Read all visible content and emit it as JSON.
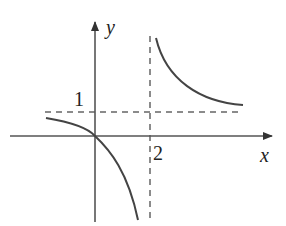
{
  "figure": {
    "type": "function graph (hyperbola with asymptotes)",
    "axes": {
      "x_label": "x",
      "y_label": "y"
    },
    "tick_labels": {
      "x": "2",
      "y": "1"
    },
    "asymptotes": {
      "vertical": "x = 2",
      "horizontal": "y = 1"
    },
    "curve_passes_through": "origin (0,0)",
    "colors": {
      "axis": "#555555",
      "curve": "#444444",
      "dashed": "#666666",
      "text": "#222222"
    }
  }
}
